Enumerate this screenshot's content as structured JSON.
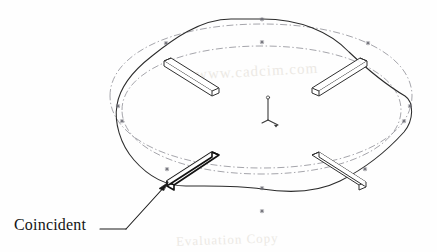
{
  "view": {
    "kind": "cad-3d-sketch-viewport",
    "width": 437,
    "height": 252,
    "background_color": "#fefefe",
    "line_color": "#2b2b2b",
    "construction_color": "#8f8f97",
    "highlight_color": "#111111"
  },
  "annotation": {
    "label": "Coincident",
    "leader_from": {
      "x": 110,
      "y": 228
    },
    "leader_bend": {
      "x": 133,
      "y": 216
    },
    "arrow_tip": {
      "x": 166,
      "y": 184
    }
  },
  "origin_triad": {
    "name": "origin",
    "x": 268,
    "y": 104,
    "axes": [
      "x",
      "y",
      "z"
    ]
  },
  "geometry": {
    "spline_outer_label": "swept profile spline",
    "construction_ellipse_upper_label": "construction ellipse upper",
    "construction_ellipse_lower_label": "construction ellipse lower",
    "plate_count": 4,
    "plates": [
      {
        "id": "plate-upper-left",
        "selected": false
      },
      {
        "id": "plate-upper-right",
        "selected": false
      },
      {
        "id": "plate-lower-left",
        "selected": true
      },
      {
        "id": "plate-lower-right",
        "selected": false
      }
    ],
    "point_markers": 12
  },
  "watermarks": [
    {
      "text": "www.cadcim.com",
      "x": 196,
      "y": 63,
      "rotate": -3,
      "size": 14
    },
    {
      "text": "Evaluation Copy",
      "x": 176,
      "y": 232,
      "rotate": -2,
      "size": 13
    }
  ]
}
